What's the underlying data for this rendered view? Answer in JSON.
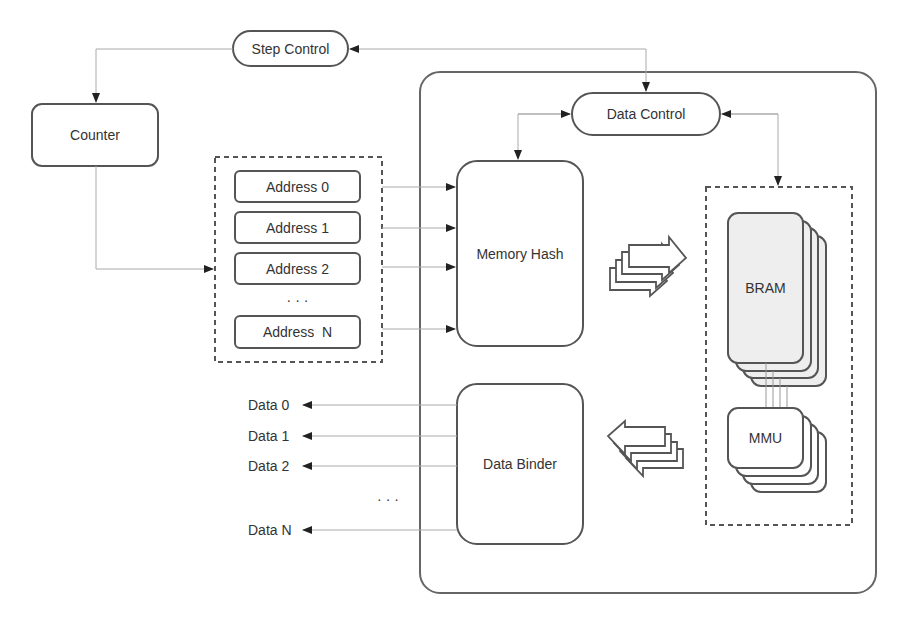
{
  "diagram": {
    "nodes": {
      "step_control": "Step Control",
      "counter": "Counter",
      "data_control": "Data Control",
      "memory_hash": "Memory Hash",
      "data_binder": "Data Binder",
      "bram": "BRAM",
      "mmu": "MMU"
    },
    "addresses": [
      "Address 0",
      "Address 1",
      "Address 2",
      "Address  N"
    ],
    "address_ellipsis": "· · ·",
    "data_outputs": [
      "Data 0",
      "Data 1",
      "Data 2",
      "Data N"
    ],
    "data_ellipsis": "· · ·"
  },
  "colors": {
    "stroke": "#555555",
    "line": "#aaaaaa",
    "bram_fill": "#eeeeee",
    "text": "#333333"
  }
}
